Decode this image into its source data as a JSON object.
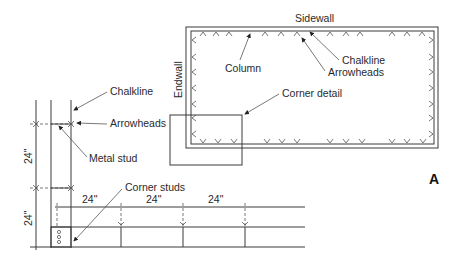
{
  "figure_label": "A",
  "plan_view": {
    "labels": {
      "sidewall": "Sidewall",
      "endwall": "Endwall",
      "column": "Column",
      "chalkline": "Chalkline",
      "arrowheads": "Arrowheads",
      "corner_detail": "Corner detail"
    }
  },
  "detail_view": {
    "labels": {
      "chalkline": "Chalkline",
      "arrowheads": "Arrowheads",
      "metal_stud": "Metal stud",
      "corner_studs": "Corner studs"
    },
    "dimensions": {
      "vertical_upper": "24\"",
      "vertical_lower": "24\"",
      "horizontal_1": "24\"",
      "horizontal_2": "24\"",
      "horizontal_3": "24\""
    }
  }
}
